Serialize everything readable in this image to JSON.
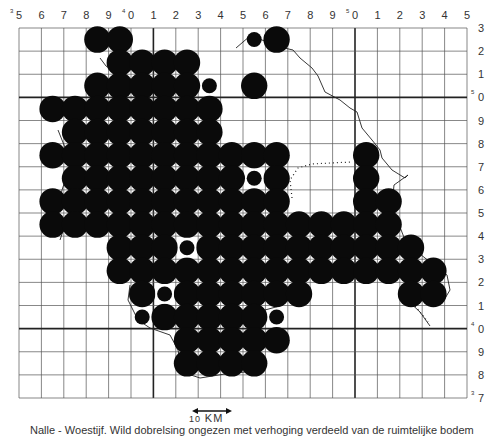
{
  "map": {
    "grid": {
      "left": 19,
      "top": 28,
      "right": 467,
      "bottom": 398,
      "cols": 20,
      "rows": 16,
      "heavy_col_index": [
        6,
        15
      ],
      "heavy_row_index": [
        3,
        13
      ]
    },
    "top_labels": [
      "5",
      "6",
      "7",
      "8",
      "9",
      "0",
      "1",
      "2",
      "3",
      "4",
      "5",
      "6",
      "7",
      "8",
      "9",
      "0",
      "1",
      "2",
      "3",
      "4",
      "5"
    ],
    "top_label_superscripts": {
      "0": "3",
      "5": "4",
      "15": "5"
    },
    "right_labels": [
      "3",
      "2",
      "1",
      "0",
      "9",
      "8",
      "7",
      "6",
      "5",
      "4",
      "3",
      "2",
      "1",
      "0",
      "9",
      "8",
      "7"
    ],
    "right_label_superscripts": {
      "3": "5",
      "13": "4",
      "16": "3"
    },
    "colors": {
      "ink": "#0a0a0a",
      "grid": "#555555",
      "paper": "#ffffff"
    },
    "dots": {
      "large": [
        [
          0,
          3
        ],
        [
          0,
          4
        ],
        [
          0,
          11
        ],
        [
          1,
          4
        ],
        [
          1,
          5
        ],
        [
          1,
          6
        ],
        [
          1,
          7
        ],
        [
          2,
          3
        ],
        [
          2,
          4
        ],
        [
          2,
          5
        ],
        [
          2,
          6
        ],
        [
          2,
          7
        ],
        [
          2,
          10
        ],
        [
          3,
          1
        ],
        [
          3,
          2
        ],
        [
          3,
          3
        ],
        [
          3,
          4
        ],
        [
          3,
          5
        ],
        [
          3,
          6
        ],
        [
          3,
          7
        ],
        [
          3,
          8
        ],
        [
          4,
          2
        ],
        [
          4,
          3
        ],
        [
          4,
          4
        ],
        [
          4,
          5
        ],
        [
          4,
          6
        ],
        [
          4,
          7
        ],
        [
          4,
          8
        ],
        [
          5,
          1
        ],
        [
          5,
          2
        ],
        [
          5,
          3
        ],
        [
          5,
          4
        ],
        [
          5,
          5
        ],
        [
          5,
          6
        ],
        [
          5,
          7
        ],
        [
          5,
          8
        ],
        [
          5,
          9
        ],
        [
          5,
          10
        ],
        [
          5,
          11
        ],
        [
          5,
          15
        ],
        [
          6,
          2
        ],
        [
          6,
          3
        ],
        [
          6,
          4
        ],
        [
          6,
          5
        ],
        [
          6,
          6
        ],
        [
          6,
          7
        ],
        [
          6,
          8
        ],
        [
          6,
          9
        ],
        [
          6,
          11
        ],
        [
          6,
          15
        ],
        [
          7,
          1
        ],
        [
          7,
          2
        ],
        [
          7,
          3
        ],
        [
          7,
          4
        ],
        [
          7,
          5
        ],
        [
          7,
          6
        ],
        [
          7,
          7
        ],
        [
          7,
          8
        ],
        [
          7,
          9
        ],
        [
          7,
          10
        ],
        [
          7,
          11
        ],
        [
          7,
          15
        ],
        [
          7,
          16
        ],
        [
          8,
          1
        ],
        [
          8,
          2
        ],
        [
          8,
          3
        ],
        [
          8,
          4
        ],
        [
          8,
          5
        ],
        [
          8,
          6
        ],
        [
          8,
          7
        ],
        [
          8,
          8
        ],
        [
          8,
          9
        ],
        [
          8,
          10
        ],
        [
          8,
          11
        ],
        [
          8,
          12
        ],
        [
          8,
          13
        ],
        [
          8,
          14
        ],
        [
          8,
          15
        ],
        [
          8,
          16
        ],
        [
          9,
          4
        ],
        [
          9,
          5
        ],
        [
          9,
          6
        ],
        [
          9,
          8
        ],
        [
          9,
          9
        ],
        [
          9,
          10
        ],
        [
          9,
          11
        ],
        [
          9,
          12
        ],
        [
          9,
          13
        ],
        [
          9,
          14
        ],
        [
          9,
          15
        ],
        [
          9,
          16
        ],
        [
          9,
          17
        ],
        [
          10,
          4
        ],
        [
          10,
          5
        ],
        [
          10,
          6
        ],
        [
          10,
          7
        ],
        [
          10,
          8
        ],
        [
          10,
          9
        ],
        [
          10,
          10
        ],
        [
          10,
          11
        ],
        [
          10,
          12
        ],
        [
          10,
          13
        ],
        [
          10,
          14
        ],
        [
          10,
          15
        ],
        [
          10,
          16
        ],
        [
          10,
          17
        ],
        [
          10,
          18
        ],
        [
          11,
          5
        ],
        [
          11,
          7
        ],
        [
          11,
          8
        ],
        [
          11,
          9
        ],
        [
          11,
          10
        ],
        [
          11,
          11
        ],
        [
          11,
          12
        ],
        [
          11,
          17
        ],
        [
          11,
          18
        ],
        [
          12,
          6
        ],
        [
          12,
          7
        ],
        [
          12,
          8
        ],
        [
          12,
          9
        ],
        [
          12,
          10
        ],
        [
          13,
          7
        ],
        [
          13,
          8
        ],
        [
          13,
          9
        ],
        [
          13,
          10
        ],
        [
          13,
          11
        ],
        [
          14,
          7
        ],
        [
          14,
          8
        ],
        [
          14,
          9
        ],
        [
          14,
          10
        ]
      ],
      "small": [
        [
          0,
          10
        ],
        [
          2,
          8
        ],
        [
          6,
          10
        ],
        [
          9,
          7
        ],
        [
          11,
          6
        ],
        [
          12,
          5
        ],
        [
          12,
          11
        ]
      ],
      "small_in_white_square": [
        [
          6,
          10
        ],
        [
          9,
          7
        ],
        [
          11,
          6
        ]
      ]
    },
    "scale_bar": {
      "value": "10",
      "unit": "KM"
    },
    "caption": "Nalle - Woestijf. Wild dobrelsing ongezen met verhoging verdeeld van de ruimtelijke bodem"
  }
}
